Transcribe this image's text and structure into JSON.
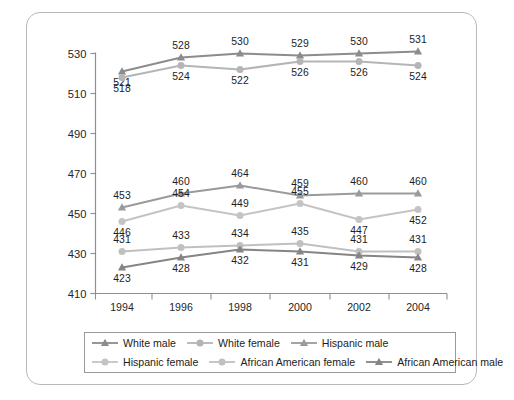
{
  "chart_data": {
    "type": "line",
    "title": "",
    "subtitle": "",
    "xlabel": "",
    "ylabel": "",
    "categories": [
      "1994",
      "1996",
      "1998",
      "2000",
      "2002",
      "2004"
    ],
    "x": [
      1994,
      1996,
      1998,
      2000,
      2002,
      2004
    ],
    "ylim": [
      410,
      530
    ],
    "yticks": [
      410,
      430,
      450,
      470,
      490,
      510,
      530
    ],
    "ytick_labels": [
      "410",
      "430",
      "450",
      "470",
      "490",
      "510",
      "530"
    ],
    "grid": false,
    "legend_position": "bottom",
    "legend_columns": 3,
    "legend_rows": 2,
    "data_labels": true,
    "series": [
      {
        "name": "White male",
        "marker": "triangle",
        "color": "#8c8c8c",
        "values": [
          521,
          528,
          530,
          529,
          530,
          531
        ],
        "label_positions": [
          "below",
          "above",
          "above",
          "above",
          "above",
          "above"
        ]
      },
      {
        "name": "White female",
        "marker": "circle",
        "color": "#b5b5b5",
        "values": [
          518,
          524,
          522,
          526,
          526,
          524
        ],
        "label_positions": [
          "below",
          "below",
          "below",
          "below",
          "below",
          "below"
        ]
      },
      {
        "name": "Hispanic male",
        "marker": "triangle",
        "color": "#9a9a9a",
        "values": [
          453,
          460,
          464,
          459,
          460,
          460
        ],
        "label_positions": [
          "above",
          "above",
          "above",
          "above",
          "above",
          "above"
        ]
      },
      {
        "name": "Hispanic female",
        "marker": "circle",
        "color": "#c4c4c4",
        "values": [
          446,
          454,
          449,
          455,
          447,
          452
        ],
        "label_positions": [
          "below",
          "above",
          "above",
          "above",
          "below",
          "below"
        ]
      },
      {
        "name": "African American female",
        "marker": "circle",
        "color": "#c0c0c0",
        "values": [
          431,
          433,
          434,
          435,
          431,
          431
        ],
        "label_positions": [
          "above",
          "above",
          "above",
          "above",
          "above",
          "above"
        ]
      },
      {
        "name": "African American male",
        "marker": "triangle",
        "color": "#858585",
        "values": [
          423,
          428,
          432,
          431,
          429,
          428
        ],
        "label_positions": [
          "below",
          "below",
          "below",
          "below",
          "below",
          "below"
        ]
      }
    ]
  },
  "legend": {
    "entries": [
      {
        "label": "White male",
        "marker": "triangle",
        "color": "#8c8c8c"
      },
      {
        "label": "White female",
        "marker": "circle",
        "color": "#b5b5b5"
      },
      {
        "label": "Hispanic male",
        "marker": "triangle",
        "color": "#9a9a9a"
      },
      {
        "label": "Hispanic female",
        "marker": "circle",
        "color": "#c4c4c4"
      },
      {
        "label": "African American female",
        "marker": "circle",
        "color": "#c0c0c0"
      },
      {
        "label": "African American male",
        "marker": "triangle",
        "color": "#858585"
      }
    ]
  },
  "axes": {
    "axis_color": "#8f8f8f",
    "frame_color": "#b9b9b9",
    "background": "#ffffff"
  }
}
